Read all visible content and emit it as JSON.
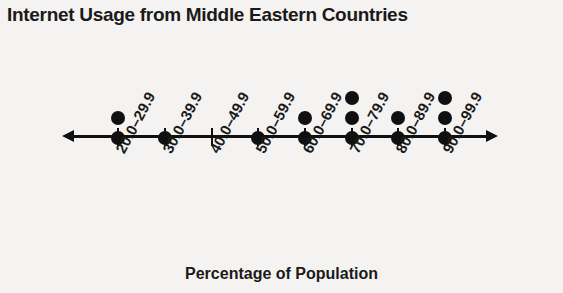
{
  "chart_data": {
    "type": "bar",
    "title": "Internet Usage from Middle Eastern Countries",
    "xlabel": "Percentage of Population",
    "ylabel": "",
    "categories": [
      "20.0–29.9",
      "30.0–39.9",
      "40.0–49.9",
      "50.0–59.9",
      "60.0–69.9",
      "70.0–79.9",
      "80.0–89.9",
      "90.0–99.9"
    ],
    "values": [
      2,
      1,
      0,
      1,
      2,
      3,
      2,
      3
    ],
    "ylim": [
      0,
      3
    ],
    "grid": false,
    "legend": null
  },
  "figure": {
    "title": "Internet Usage from Middle Eastern Countries",
    "axis_label": "Percentage of Population",
    "ticks": [
      {
        "label": "20.0–29.9",
        "x": 118,
        "dots": 2
      },
      {
        "label": "30.0–39.9",
        "x": 165,
        "dots": 1
      },
      {
        "label": "40.0–49.9",
        "x": 212,
        "dots": 0
      },
      {
        "label": "50.0–59.9",
        "x": 258,
        "dots": 1
      },
      {
        "label": "60.0–69.9",
        "x": 305,
        "dots": 2
      },
      {
        "label": "70.0–79.9",
        "x": 352,
        "dots": 3
      },
      {
        "label": "80.0–89.9",
        "x": 398,
        "dots": 2
      },
      {
        "label": "90.0–99.9",
        "x": 445,
        "dots": 3
      }
    ],
    "colors": {
      "dot": "#101010",
      "axis": "#101010",
      "text": "#1a1a1a",
      "background": "#f4f3f1"
    }
  }
}
